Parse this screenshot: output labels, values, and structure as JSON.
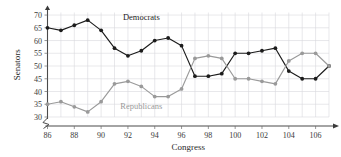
{
  "chart_data": {
    "type": "line",
    "title": "",
    "xlabel": "Congress",
    "ylabel": "Senators",
    "x": [
      86,
      87,
      88,
      89,
      90,
      91,
      92,
      93,
      94,
      95,
      96,
      97,
      98,
      99,
      100,
      101,
      102,
      103,
      104,
      105,
      106,
      107
    ],
    "xlim": [
      86,
      107
    ],
    "ylim": [
      30,
      71
    ],
    "xticks": [
      86,
      88,
      90,
      92,
      94,
      96,
      98,
      100,
      102,
      104,
      106
    ],
    "xtick_labels": [
      "86",
      "88",
      "90",
      "92",
      "94",
      "96",
      "98",
      "100",
      "102",
      "104",
      "106"
    ],
    "yticks": [
      30,
      35,
      40,
      45,
      50,
      55,
      60,
      65,
      70
    ],
    "ytick_labels": [
      "30",
      "35",
      "40",
      "45",
      "50",
      "55",
      "60",
      "65",
      "70"
    ],
    "grid": true,
    "legend_position": "inline-annotation",
    "axis_break": true,
    "series": [
      {
        "name": "Democrats",
        "color": "#1c1c1c",
        "label_x": 93.0,
        "label_y": 68.0,
        "values": [
          65,
          64,
          66,
          68,
          64,
          57,
          54,
          56,
          60,
          61,
          58,
          46,
          46,
          47,
          55,
          55,
          56,
          57,
          48,
          45,
          45,
          50
        ]
      },
      {
        "name": "Republicans",
        "color": "#9a9a9a",
        "label_x": 93.0,
        "label_y": 33.0,
        "values": [
          35,
          36,
          34,
          32,
          36,
          43,
          44,
          42,
          38,
          38,
          41,
          53,
          54,
          53,
          45,
          45,
          44,
          43,
          52,
          55,
          55,
          50
        ]
      }
    ]
  },
  "labels": {
    "xlabel": "Congress",
    "ylabel": "Senators",
    "democrats": "Democrats",
    "republicans": "Republicans"
  },
  "colors": {
    "democrats": "#1c1c1c",
    "republicans": "#9a9a9a",
    "grid": "#d8d8dd",
    "axis": "#4a4a4a",
    "background": "#ffffff"
  }
}
